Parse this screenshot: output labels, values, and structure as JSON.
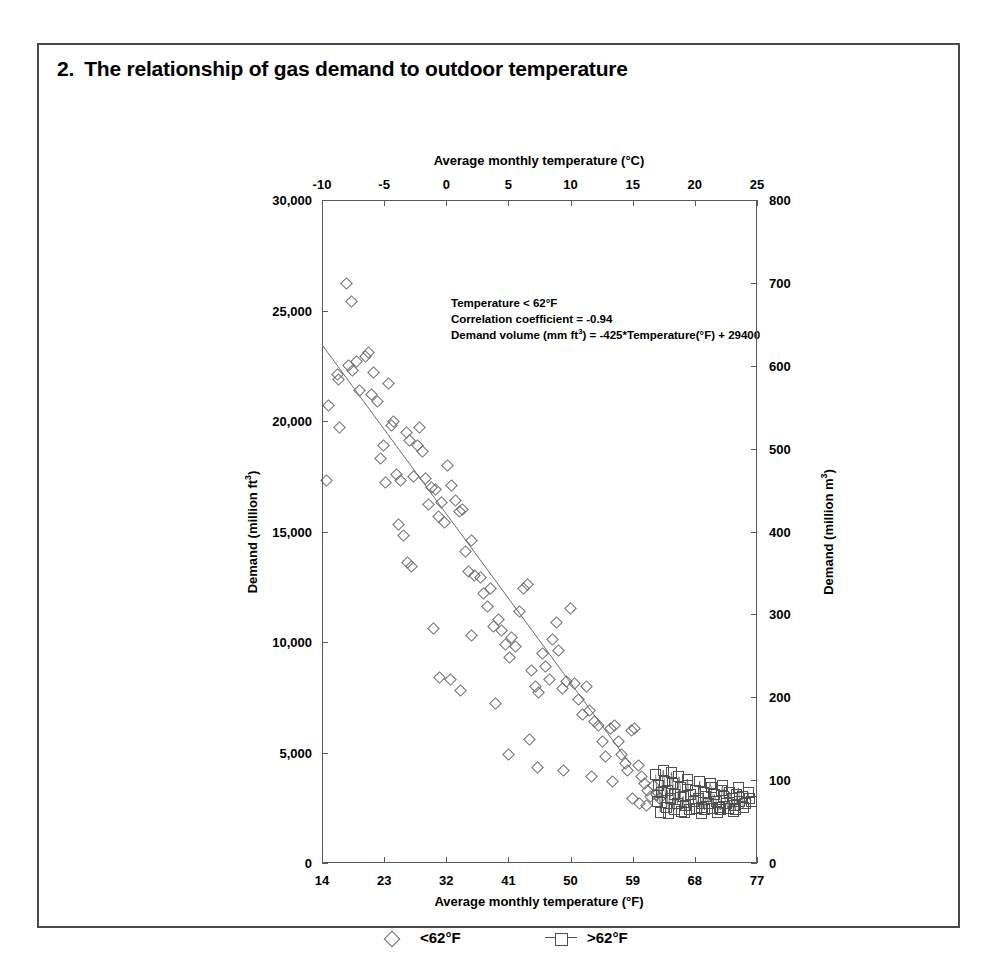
{
  "figure": {
    "number": "2.",
    "title": "The relationship of gas demand to outdoor temperature"
  },
  "annotation": {
    "line1": "Temperature < 62°F",
    "line2": "Correlation coefficient = -0.94",
    "line3_prefix": "Demand volume (mm ft",
    "line3_sup": "3",
    "line3_suffix": ") = -425*Temperature(°F) + 29400"
  },
  "legend": {
    "position": "bottom",
    "items": [
      {
        "label": "<62°F",
        "marker": "diamond-marker"
      },
      {
        "label": ">62°F",
        "marker": "square-line-marker"
      }
    ]
  },
  "chart_data": {
    "type": "scatter",
    "title": "The relationship of gas demand to outdoor temperature",
    "xlabel": "Average monthly temperature (°F)",
    "ylabel": "Demand (million ft3)",
    "xlabel_top": "Average monthly temperature (°C)",
    "ylabel_right": "Demand (million m3)",
    "grid": false,
    "xlim": [
      14,
      77
    ],
    "ylim": [
      0,
      30000
    ],
    "xlim_top": [
      -10,
      25
    ],
    "ylim_right": [
      0,
      800
    ],
    "xticks": [
      14,
      23,
      32,
      41,
      50,
      59,
      68,
      77
    ],
    "xticklabels": [
      "14",
      "23",
      "32",
      "41",
      "50",
      "59",
      "68",
      "77"
    ],
    "yticks": [
      0,
      5000,
      10000,
      15000,
      20000,
      25000,
      30000
    ],
    "yticklabels": [
      "0",
      "5,000",
      "10,000",
      "15,000",
      "20,000",
      "25,000",
      "30,000"
    ],
    "xticks_top": [
      -10,
      -5,
      0,
      5,
      10,
      15,
      20,
      25
    ],
    "xticklabels_top": [
      "-10",
      "-5",
      "0",
      "5",
      "10",
      "15",
      "20",
      "25"
    ],
    "yticks_right": [
      0,
      100,
      200,
      300,
      400,
      500,
      600,
      700,
      800
    ],
    "yticklabels_right": [
      "0",
      "100",
      "200",
      "300",
      "400",
      "500",
      "600",
      "700",
      "800"
    ],
    "trendline": {
      "slope": -425,
      "intercept": 29400,
      "x_start": 14,
      "x_end": 58.5,
      "equation": "Demand volume (mm ft3) = -425*Temperature(°F) + 29400",
      "correlation_coefficient": -0.94
    },
    "series": [
      {
        "name": "<62°F",
        "marker": "diamond",
        "points": [
          [
            14.6,
            17300
          ],
          [
            14.9,
            20700
          ],
          [
            16.2,
            22100
          ],
          [
            16.4,
            21900
          ],
          [
            16.6,
            19700
          ],
          [
            17.5,
            26200
          ],
          [
            18.3,
            25400
          ],
          [
            17.9,
            22500
          ],
          [
            18.4,
            22300
          ],
          [
            19.0,
            22700
          ],
          [
            19.4,
            21400
          ],
          [
            20.3,
            22900
          ],
          [
            20.8,
            23100
          ],
          [
            21.4,
            22200
          ],
          [
            21.1,
            21200
          ],
          [
            22.0,
            20900
          ],
          [
            22.4,
            18300
          ],
          [
            22.9,
            18900
          ],
          [
            23.6,
            21700
          ],
          [
            24.4,
            20000
          ],
          [
            24.0,
            19800
          ],
          [
            23.2,
            17200
          ],
          [
            24.8,
            17600
          ],
          [
            25.4,
            17300
          ],
          [
            25.8,
            14800
          ],
          [
            25.1,
            15300
          ],
          [
            26.2,
            19500
          ],
          [
            26.7,
            19100
          ],
          [
            27.3,
            17500
          ],
          [
            27.8,
            18900
          ],
          [
            28.1,
            19700
          ],
          [
            28.6,
            18600
          ],
          [
            29.0,
            17400
          ],
          [
            29.4,
            16200
          ],
          [
            29.9,
            17000
          ],
          [
            30.5,
            16900
          ],
          [
            30.9,
            15700
          ],
          [
            31.3,
            16300
          ],
          [
            31.7,
            15400
          ],
          [
            26.4,
            13600
          ],
          [
            27.0,
            13400
          ],
          [
            32.2,
            18000
          ],
          [
            32.8,
            17100
          ],
          [
            33.4,
            16400
          ],
          [
            33.9,
            15900
          ],
          [
            34.3,
            16000
          ],
          [
            30.2,
            10600
          ],
          [
            31.0,
            8400
          ],
          [
            32.6,
            8300
          ],
          [
            34.8,
            14100
          ],
          [
            35.2,
            13200
          ],
          [
            35.7,
            14600
          ],
          [
            36.1,
            13000
          ],
          [
            34.0,
            7800
          ],
          [
            36.9,
            12900
          ],
          [
            37.4,
            12200
          ],
          [
            37.9,
            11600
          ],
          [
            38.4,
            12400
          ],
          [
            38.9,
            10700
          ],
          [
            35.6,
            10300
          ],
          [
            39.5,
            11000
          ],
          [
            40.0,
            10500
          ],
          [
            40.6,
            9900
          ],
          [
            41.1,
            9300
          ],
          [
            41.5,
            10200
          ],
          [
            42.0,
            9800
          ],
          [
            42.6,
            11400
          ],
          [
            43.2,
            12400
          ],
          [
            43.8,
            12600
          ],
          [
            39.1,
            7200
          ],
          [
            41.0,
            4900
          ],
          [
            44.3,
            8700
          ],
          [
            44.9,
            8000
          ],
          [
            45.4,
            7700
          ],
          [
            45.9,
            9500
          ],
          [
            46.4,
            8900
          ],
          [
            46.9,
            8300
          ],
          [
            47.4,
            10100
          ],
          [
            47.9,
            10900
          ],
          [
            48.3,
            9600
          ],
          [
            48.9,
            7900
          ],
          [
            49.4,
            8200
          ],
          [
            44.1,
            5600
          ],
          [
            45.2,
            4300
          ],
          [
            50.0,
            11500
          ],
          [
            50.6,
            8100
          ],
          [
            51.2,
            7400
          ],
          [
            51.7,
            6700
          ],
          [
            52.3,
            8000
          ],
          [
            52.8,
            6900
          ],
          [
            49.0,
            4200
          ],
          [
            53.4,
            6400
          ],
          [
            54.0,
            6200
          ],
          [
            54.6,
            5500
          ],
          [
            55.1,
            4800
          ],
          [
            53.0,
            3900
          ],
          [
            55.8,
            6100
          ],
          [
            56.4,
            6200
          ],
          [
            56.9,
            5500
          ],
          [
            57.4,
            4900
          ],
          [
            57.9,
            4500
          ],
          [
            58.3,
            4200
          ],
          [
            58.8,
            6000
          ],
          [
            59.3,
            6100
          ],
          [
            56.0,
            3700
          ],
          [
            59.8,
            4400
          ],
          [
            60.2,
            3900
          ],
          [
            60.7,
            3600
          ],
          [
            61.1,
            3300
          ],
          [
            61.6,
            3000
          ],
          [
            59.0,
            2900
          ],
          [
            60.0,
            2700
          ],
          [
            62.0,
            3500
          ],
          [
            62.4,
            3100
          ],
          [
            62.9,
            2900
          ],
          [
            61.0,
            2600
          ]
        ]
      },
      {
        "name": ">62°F",
        "marker": "square",
        "points": [
          [
            62.3,
            4000
          ],
          [
            62.8,
            3500
          ],
          [
            63.2,
            3200
          ],
          [
            63.6,
            3700
          ],
          [
            64.0,
            3300
          ],
          [
            64.4,
            2900
          ],
          [
            64.8,
            3600
          ],
          [
            65.1,
            3100
          ],
          [
            65.5,
            2700
          ],
          [
            65.9,
            3400
          ],
          [
            66.3,
            3000
          ],
          [
            66.7,
            2600
          ],
          [
            67.0,
            3500
          ],
          [
            67.4,
            3100
          ],
          [
            67.8,
            2800
          ],
          [
            68.1,
            3300
          ],
          [
            68.5,
            2900
          ],
          [
            68.9,
            2500
          ],
          [
            69.2,
            3200
          ],
          [
            69.6,
            3000
          ],
          [
            70.0,
            2700
          ],
          [
            70.4,
            3400
          ],
          [
            70.8,
            3100
          ],
          [
            71.1,
            2800
          ],
          [
            71.5,
            2500
          ],
          [
            71.9,
            3300
          ],
          [
            72.2,
            3000
          ],
          [
            72.6,
            2700
          ],
          [
            73.0,
            3200
          ],
          [
            73.4,
            2900
          ],
          [
            73.8,
            2600
          ],
          [
            74.1,
            3100
          ],
          [
            74.5,
            2800
          ],
          [
            74.9,
            3000
          ],
          [
            75.3,
            2700
          ],
          [
            75.7,
            3200
          ],
          [
            62.6,
            2800
          ],
          [
            63.9,
            2500
          ],
          [
            65.0,
            2400
          ],
          [
            66.0,
            2350
          ],
          [
            67.2,
            2400
          ],
          [
            68.3,
            2450
          ],
          [
            69.4,
            2400
          ],
          [
            70.6,
            2450
          ],
          [
            71.7,
            2400
          ],
          [
            72.8,
            2450
          ],
          [
            73.9,
            2400
          ],
          [
            75.0,
            2500
          ],
          [
            63.4,
            4200
          ],
          [
            65.7,
            3900
          ],
          [
            64.6,
            4100
          ],
          [
            66.9,
            3800
          ],
          [
            68.7,
            3700
          ],
          [
            70.2,
            3600
          ],
          [
            72.0,
            3500
          ],
          [
            74.3,
            3400
          ],
          [
            63.0,
            2300
          ],
          [
            64.2,
            2250
          ],
          [
            66.5,
            2300
          ],
          [
            69.0,
            2250
          ],
          [
            71.3,
            2300
          ],
          [
            73.6,
            2350
          ],
          [
            75.9,
            2900
          ],
          [
            76.2,
            2800
          ]
        ]
      }
    ]
  }
}
